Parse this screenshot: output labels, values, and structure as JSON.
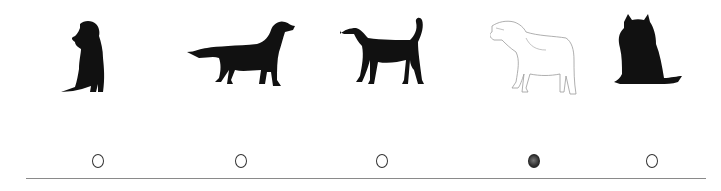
{
  "question": {
    "type": "picture-choice",
    "options": [
      {
        "id": 1,
        "figure": "sitting-labrador-silhouette",
        "style": "black-silhouette",
        "selected": false
      },
      {
        "id": 2,
        "figure": "standing-retriever-silhouette",
        "style": "black-silhouette",
        "selected": false
      },
      {
        "id": 3,
        "figure": "standing-hound-silhouette",
        "style": "black-silhouette",
        "selected": false
      },
      {
        "id": 4,
        "figure": "barking-dog-outline",
        "style": "line-drawing",
        "selected": true
      },
      {
        "id": 5,
        "figure": "sitting-wolf-like-dog-silhouette",
        "style": "black-silhouette",
        "selected": false
      }
    ]
  },
  "colors": {
    "ink": "#111111",
    "outline": "#9a9a9a",
    "rule": "#8a8a8a",
    "bubble_border": "#333333"
  }
}
